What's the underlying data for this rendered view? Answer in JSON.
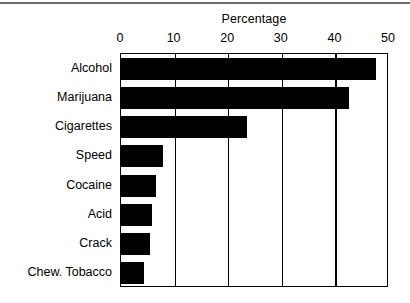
{
  "chart_data": {
    "type": "bar",
    "orientation": "horizontal",
    "title": "Percentage",
    "xlabel": "",
    "ylabel": "",
    "xlim": [
      0,
      50
    ],
    "xticks": [
      0,
      10,
      20,
      30,
      40,
      50
    ],
    "xtick_labels": [
      "0",
      "10",
      "20",
      "30",
      "40",
      "50"
    ],
    "grid": true,
    "legend": false,
    "bar_color": "#000000",
    "background_color": "#ffffff",
    "categories": [
      "Alcohol",
      "Marijuana",
      "Cigarettes",
      "Speed",
      "Cocaine",
      "Acid",
      "Crack",
      "Chew. Tobacco"
    ],
    "values": [
      47.5,
      42.5,
      23.5,
      7.8,
      6.5,
      5.8,
      5.5,
      4.3
    ]
  }
}
